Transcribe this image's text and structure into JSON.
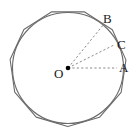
{
  "figure": {
    "type": "geometry-diagram",
    "canvas": {
      "width": 140,
      "height": 133
    },
    "background_color": "#ffffff",
    "stroke_color": "#6b6b6b",
    "dash_color": "#8a8a8a",
    "point_color": "#000000",
    "label_color": "#1a1a1a",
    "circle": {
      "name": "inscribed-circle",
      "center_x": 68,
      "center_y": 68,
      "radius": 55.5,
      "stroke_width": 1.1
    },
    "polygon": {
      "name": "circumscribed-polygon",
      "sides": 11,
      "circumradius": 58.5,
      "rotation_deg": -8,
      "stroke_width": 1.1
    },
    "center_point": {
      "name": "center-O",
      "x": 68,
      "y": 68,
      "dot_radius": 2.3
    },
    "radii": [
      {
        "name": "radius-OB",
        "to_x": 104,
        "to_y": 24,
        "label": "B"
      },
      {
        "name": "radius-OC",
        "to_x": 114,
        "to_y": 45,
        "label": "C"
      },
      {
        "name": "radius-OA",
        "to_x": 117,
        "to_y": 68,
        "label": "A"
      }
    ],
    "labels": {
      "point_b": "B",
      "point_c": "C",
      "point_a": "A",
      "point_o": "O"
    }
  }
}
